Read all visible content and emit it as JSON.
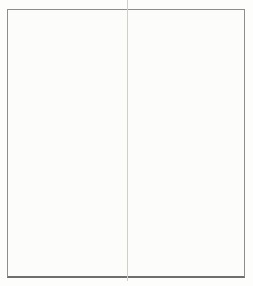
{
  "figure": {
    "background_color": "#fcfcfa",
    "frame_color": "#8d8d89",
    "fold_line_color": "#cfcfc9",
    "axis_color": "#3f3f3c"
  },
  "legend": {
    "position": "top-right",
    "items": [
      {
        "label": "Half pearls",
        "color": "#d9d9d4"
      },
      {
        "label": "Round pearls",
        "color": "#ababa5"
      }
    ]
  },
  "chart_data": {
    "type": "bar",
    "stacked": true,
    "title": "",
    "xlabel": "",
    "ylabel": "Number of pearls (x 1000)",
    "ylim": [
      0,
      800
    ],
    "y_major_ticks": [
      0,
      100,
      200,
      300,
      400,
      500,
      600,
      700,
      800
    ],
    "y_minor_ticks": [
      50,
      150,
      250,
      350,
      450,
      550,
      650,
      750
    ],
    "grid": false,
    "legend_position": "top-right",
    "categories": [
      "1963",
      "1964",
      "1965",
      "1966",
      "1967",
      "1968",
      "1969",
      "1970",
      "1971",
      "1972",
      "1973",
      "1974",
      "1975",
      "1976",
      "1977",
      "1978",
      "1979",
      "1980",
      "1981",
      "1982",
      "1983",
      "1984",
      "1985",
      "1986",
      "1987",
      "1988"
    ],
    "x_tick_labels_shown": [
      "1963",
      "1965",
      "1970",
      "1975",
      "1980",
      "1985",
      "1988"
    ],
    "series": [
      {
        "name": "Round pearls",
        "color": "#ababa5",
        "values": [
          145,
          230,
          280,
          265,
          265,
          510,
          625,
          460,
          430,
          155,
          220,
          225,
          230,
          300,
          290,
          250,
          140,
          195,
          135,
          195,
          180,
          215,
          185,
          110,
          55,
          30
        ]
      },
      {
        "name": "Half pearls",
        "color": "#d9d9d4",
        "values": [
          30,
          60,
          65,
          105,
          55,
          90,
          85,
          90,
          90,
          135,
          100,
          85,
          55,
          90,
          70,
          85,
          75,
          65,
          70,
          65,
          100,
          85,
          55,
          25,
          5,
          80
        ]
      }
    ]
  }
}
